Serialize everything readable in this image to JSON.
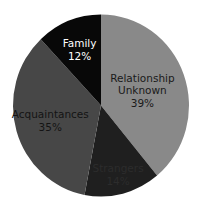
{
  "chart_data": {
    "type": "pie",
    "title": "",
    "start_angle_deg": 0,
    "direction": "clockwise",
    "slices": [
      {
        "label": "Relationship Unknown",
        "label_lines": [
          "Relationship",
          "Unknown"
        ],
        "value": 39,
        "value_label": "39%",
        "color": "#898989",
        "text_color": "#1a1a1a"
      },
      {
        "label": "Strangers",
        "label_lines": [
          "Strangers"
        ],
        "value": 14,
        "value_label": "14%",
        "color": "#1f1f1f",
        "text_color": "#2c2c2c"
      },
      {
        "label": "Acquaintances",
        "label_lines": [
          "Acquaintances"
        ],
        "value": 35,
        "value_label": "35%",
        "color": "#474747",
        "text_color": "#141414"
      },
      {
        "label": "Family",
        "label_lines": [
          "Family"
        ],
        "value": 12,
        "value_label": "12%",
        "color": "#080808",
        "text_color": "#ffffff"
      }
    ],
    "legend": null,
    "grid": false
  }
}
